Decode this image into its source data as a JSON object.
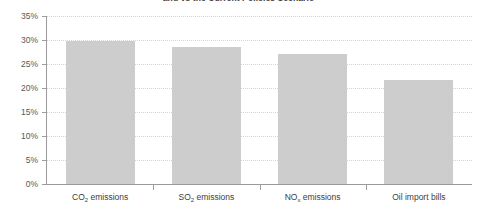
{
  "chart_data": {
    "type": "bar",
    "title": "and vs the Current Policies Scenario",
    "xlabel": "",
    "ylabel": "",
    "categories": [
      "CO2 emissions",
      "SO2 emissions",
      "NOx emissions",
      "Oil import bills"
    ],
    "category_labels": [
      {
        "base": "CO",
        "sub": "2",
        "tail": " emissions"
      },
      {
        "base": "SO",
        "sub": "2",
        "tail": " emissions"
      },
      {
        "base": "NO",
        "sub": "x",
        "tail": " emissions"
      },
      {
        "base": "Oil import bills",
        "sub": "",
        "tail": ""
      }
    ],
    "values": [
      29.8,
      28.5,
      27.0,
      21.7
    ],
    "ylim": [
      0,
      35
    ],
    "ytick_values": [
      0,
      5,
      10,
      15,
      20,
      25,
      30,
      35
    ],
    "ytick_labels": [
      "0%",
      "5%",
      "10%",
      "15%",
      "20%",
      "25%",
      "30%",
      "35%"
    ],
    "grid": true,
    "grid_style": "dotted",
    "legend": "none",
    "series": [
      {
        "name": "Reduction vs Current Policies Scenario",
        "values": [
          29.8,
          28.5,
          27.0,
          21.7
        ]
      }
    ]
  },
  "style": {
    "bar_color": "#cdcdcd",
    "grid_color": "#d5d5d8",
    "axis_color": "#9b9b9e",
    "text_color": "#58585a",
    "label_color": "#3d3d40",
    "background": "#ffffff"
  }
}
